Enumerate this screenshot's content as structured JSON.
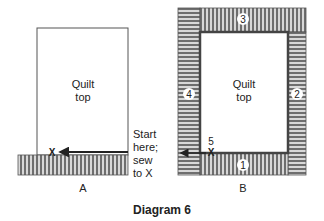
{
  "title": "Diagram 6",
  "panel_a": {
    "label": "A",
    "quilt_top_line1": "Quilt",
    "quilt_top_line2": "top",
    "marker": "X",
    "instruction": [
      "Start",
      "here;",
      "sew",
      "to X"
    ]
  },
  "panel_b": {
    "label": "B",
    "quilt_top_line1": "Quilt",
    "quilt_top_line2": "top",
    "marker": "X",
    "marker_number": "5",
    "borders": {
      "bottom": "1",
      "right": "2",
      "top": "3",
      "left": "4"
    }
  },
  "colors": {
    "stripe_dark": "#6e6e6e",
    "stripe_light": "#d8d8d8",
    "outline": "#444444",
    "text": "#222222"
  }
}
